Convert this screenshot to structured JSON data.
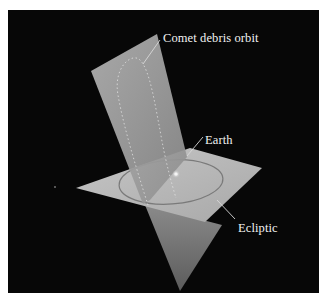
{
  "figure": {
    "background": "#070707",
    "labels": {
      "comet_orbit": "Comet debris orbit",
      "earth": "Earth",
      "ecliptic": "Ecliptic"
    },
    "colors": {
      "orbital_plane": "#a9a9a9",
      "ecliptic_plane": "#bdbdbd",
      "lower_plane": "#7f7f7f",
      "label_text": "#f2f2f2",
      "leader_line": "#d8d8d8"
    }
  }
}
